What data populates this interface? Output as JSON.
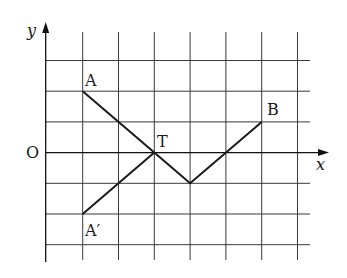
{
  "diagram": {
    "type": "coordinate-grid-geometry",
    "axes": {
      "x_label": "x",
      "y_label": "y",
      "origin_label": "O"
    },
    "grid": {
      "x_lines": [
        1,
        2,
        3,
        4,
        5,
        6,
        7
      ],
      "y_lines": [
        3,
        2,
        1,
        -1,
        -2,
        -3
      ],
      "x_range": [
        0,
        7
      ],
      "y_range": [
        -3.5,
        4
      ]
    },
    "points": [
      {
        "label": "A",
        "x": 1,
        "y": 2
      },
      {
        "label": "T",
        "x": 3,
        "y": 0
      },
      {
        "label": "B",
        "x": 6,
        "y": 1
      },
      {
        "label": "A′",
        "x": 1,
        "y": -2
      }
    ],
    "segments": [
      {
        "from": "A",
        "to": "T"
      },
      {
        "from": "T",
        "to": "(4,-1)"
      },
      {
        "from": "(4,-1)",
        "to": "B"
      },
      {
        "from": "A′",
        "to": "T"
      }
    ],
    "colors": {
      "line": "#1a1a1a",
      "grid": "#3a3a3a",
      "background": "#ffffff"
    }
  }
}
